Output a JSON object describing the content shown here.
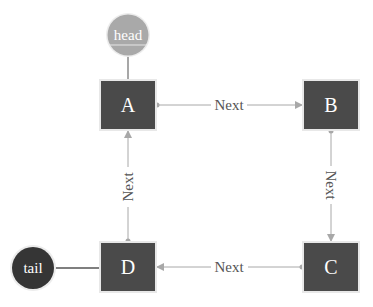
{
  "diagram": {
    "type": "linked-list",
    "colors": {
      "node_fill": "#4a4a4a",
      "node_border": "#e6e6e6",
      "edge": "#a8a8a8",
      "head_fill": "#a9a9a9",
      "tail_fill": "#353535",
      "label_text": "#ffffff",
      "edge_text": "#555555"
    },
    "pointers": [
      {
        "id": "head",
        "label": "head",
        "points_to": "A"
      },
      {
        "id": "tail",
        "label": "tail",
        "points_to": "D"
      }
    ],
    "nodes": [
      {
        "id": "A",
        "label": "A"
      },
      {
        "id": "B",
        "label": "B"
      },
      {
        "id": "C",
        "label": "C"
      },
      {
        "id": "D",
        "label": "D"
      }
    ],
    "edges": [
      {
        "from": "A",
        "to": "B",
        "label": "Next"
      },
      {
        "from": "B",
        "to": "C",
        "label": "Next"
      },
      {
        "from": "C",
        "to": "D",
        "label": "Next"
      },
      {
        "from": "D",
        "to": "A",
        "label": "Next"
      }
    ]
  }
}
